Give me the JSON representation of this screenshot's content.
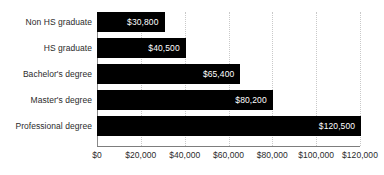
{
  "chart_data": {
    "type": "bar",
    "orientation": "horizontal",
    "title": "",
    "subtitle": "",
    "xlabel": "",
    "ylabel": "",
    "categories": [
      "Non HS graduate",
      "HS graduate",
      "Bachelor's degree",
      "Master's degree",
      "Professional degree"
    ],
    "values": [
      30800,
      40500,
      65400,
      80200,
      120500
    ],
    "value_labels": [
      "$30,800",
      "$40,500",
      "$65,400",
      "$80,200",
      "$120,500"
    ],
    "xlim": [
      0,
      120000
    ],
    "xticks": [
      0,
      20000,
      40000,
      60000,
      80000,
      100000,
      120000
    ],
    "xtick_labels": [
      "$0",
      "$20,000",
      "$40,000",
      "$60,000",
      "$80,000",
      "$100,000",
      "$120,000"
    ],
    "grid": true,
    "grid_axis": "x",
    "legend": false,
    "bar_color": "#000000",
    "value_label_color": "#ffffff",
    "grid_color": "#c9c9c9",
    "axis_color": "#7d7d7d",
    "text_color": "#2b2b2b",
    "background_color": "#ffffff"
  }
}
